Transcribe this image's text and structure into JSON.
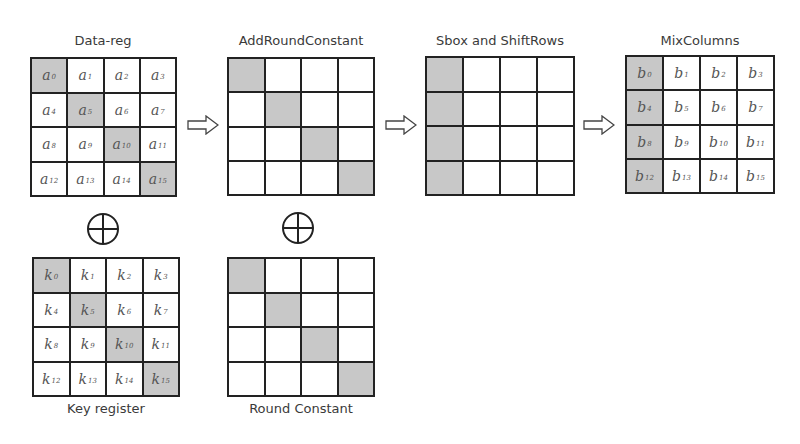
{
  "diagram": {
    "title_data_reg": "Data-reg",
    "title_add_round_constant": "AddRoundConstant",
    "title_sbox_shiftrows": "Sbox and ShiftRows",
    "title_mixcolumns": "MixColumns",
    "label_key_register": "Key register",
    "label_round_constant": "Round Constant",
    "shade_color": "#c8c8c8",
    "data_reg": {
      "letter": "a",
      "cells": [
        [
          {
            "sub": "0",
            "shaded": true
          },
          {
            "sub": "1",
            "shaded": false
          },
          {
            "sub": "2",
            "shaded": false
          },
          {
            "sub": "3",
            "shaded": false
          }
        ],
        [
          {
            "sub": "4",
            "shaded": false
          },
          {
            "sub": "5",
            "shaded": true
          },
          {
            "sub": "6",
            "shaded": false
          },
          {
            "sub": "7",
            "shaded": false
          }
        ],
        [
          {
            "sub": "8",
            "shaded": false
          },
          {
            "sub": "9",
            "shaded": false
          },
          {
            "sub": "10",
            "shaded": true
          },
          {
            "sub": "11",
            "shaded": false
          }
        ],
        [
          {
            "sub": "12",
            "shaded": false
          },
          {
            "sub": "13",
            "shaded": false
          },
          {
            "sub": "14",
            "shaded": false
          },
          {
            "sub": "15",
            "shaded": true
          }
        ]
      ]
    },
    "key_register": {
      "letter": "k",
      "cells": [
        [
          {
            "sub": "0",
            "shaded": true
          },
          {
            "sub": "1",
            "shaded": false
          },
          {
            "sub": "2",
            "shaded": false
          },
          {
            "sub": "3",
            "shaded": false
          }
        ],
        [
          {
            "sub": "4",
            "shaded": false
          },
          {
            "sub": "5",
            "shaded": true
          },
          {
            "sub": "6",
            "shaded": false
          },
          {
            "sub": "7",
            "shaded": false
          }
        ],
        [
          {
            "sub": "8",
            "shaded": false
          },
          {
            "sub": "9",
            "shaded": false
          },
          {
            "sub": "10",
            "shaded": true
          },
          {
            "sub": "11",
            "shaded": false
          }
        ],
        [
          {
            "sub": "12",
            "shaded": false
          },
          {
            "sub": "13",
            "shaded": false
          },
          {
            "sub": "14",
            "shaded": false
          },
          {
            "sub": "15",
            "shaded": true
          }
        ]
      ]
    },
    "add_round_constant": {
      "shaded": [
        [
          0,
          0
        ],
        [
          1,
          1
        ],
        [
          2,
          2
        ],
        [
          3,
          3
        ]
      ]
    },
    "round_constant": {
      "shaded": [
        [
          0,
          0
        ],
        [
          1,
          1
        ],
        [
          2,
          2
        ],
        [
          3,
          3
        ]
      ]
    },
    "sbox_shiftrows": {
      "shaded": [
        [
          0,
          0
        ],
        [
          1,
          0
        ],
        [
          2,
          0
        ],
        [
          3,
          0
        ]
      ]
    },
    "mixcolumns": {
      "letter": "b",
      "cells": [
        [
          {
            "sub": "0",
            "shaded": true
          },
          {
            "sub": "1",
            "shaded": false
          },
          {
            "sub": "2",
            "shaded": false
          },
          {
            "sub": "3",
            "shaded": false
          }
        ],
        [
          {
            "sub": "4",
            "shaded": true
          },
          {
            "sub": "5",
            "shaded": false
          },
          {
            "sub": "6",
            "shaded": false
          },
          {
            "sub": "7",
            "shaded": false
          }
        ],
        [
          {
            "sub": "8",
            "shaded": true
          },
          {
            "sub": "9",
            "shaded": false
          },
          {
            "sub": "10",
            "shaded": false
          },
          {
            "sub": "11",
            "shaded": false
          }
        ],
        [
          {
            "sub": "12",
            "shaded": true
          },
          {
            "sub": "13",
            "shaded": false
          },
          {
            "sub": "14",
            "shaded": false
          },
          {
            "sub": "15",
            "shaded": false
          }
        ]
      ]
    },
    "icons": {
      "arrow": "right-hollow-arrow-icon",
      "xor": "xor-circle-plus-icon"
    }
  }
}
